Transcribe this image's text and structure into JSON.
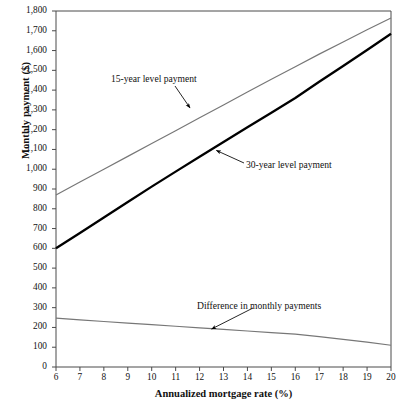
{
  "chart_data": {
    "type": "line",
    "title": "",
    "xlabel": "Annualized mortgage rate (%)",
    "ylabel": "Monthly payment ($)",
    "xlim": [
      6,
      20
    ],
    "ylim": [
      0,
      1800
    ],
    "grid": false,
    "legend_position": "inline-annotations",
    "x": [
      6,
      7,
      8,
      9,
      10,
      11,
      12,
      13,
      14,
      15,
      16,
      17,
      18,
      19,
      20
    ],
    "xticklabels": [
      "6",
      "7",
      "8",
      "9",
      "10",
      "11",
      "12",
      "13",
      "14",
      "15",
      "16",
      "17",
      "18",
      "19",
      "20"
    ],
    "yticks": [
      0,
      100,
      200,
      300,
      400,
      500,
      600,
      700,
      800,
      900,
      1000,
      1100,
      1200,
      1300,
      1400,
      1500,
      1600,
      1700,
      1800
    ],
    "yticklabels": [
      "0",
      "100",
      "200",
      "300",
      "400",
      "500",
      "600",
      "700",
      "800",
      "900",
      "1,000",
      "1,100",
      "1,200",
      "1,300",
      "1,400",
      "1,500",
      "1,600",
      "1,700",
      "1,800"
    ],
    "series": [
      {
        "name": "15-year level payment",
        "color": "#777777",
        "width": 1.2,
        "values": [
          870,
          935,
          1000,
          1065,
          1130,
          1195,
          1260,
          1325,
          1390,
          1455,
          1518,
          1582,
          1643,
          1705,
          1765
        ]
      },
      {
        "name": "30-year level payment",
        "color": "#000000",
        "width": 2.3,
        "values": [
          600,
          678,
          756,
          834,
          912,
          988,
          1063,
          1138,
          1212,
          1286,
          1360,
          1442,
          1522,
          1603,
          1685
        ]
      },
      {
        "name": "Difference in monthly payments",
        "color": "#777777",
        "width": 1.2,
        "values": [
          247,
          238,
          230,
          222,
          214,
          206,
          198,
          190,
          182,
          174,
          166,
          154,
          140,
          126,
          110
        ]
      }
    ],
    "annotations": [
      {
        "text": "15-year level payment",
        "target_x": 11.6,
        "target_y": 1310
      },
      {
        "text": "30-year level payment",
        "target_x": 12.7,
        "target_y": 1095
      },
      {
        "text": "Difference in monthly payments",
        "target_x": 12.5,
        "target_y": 192
      }
    ]
  }
}
